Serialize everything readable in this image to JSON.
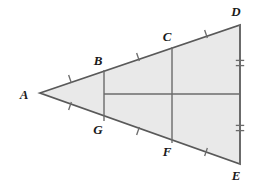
{
  "figure": {
    "type": "geometry-diagram",
    "fill_color": "#e9e9e9",
    "stroke_color": "#6b6b6b",
    "outline_color": "#595959",
    "label_color": "#1a1a1a",
    "background_color": "#ffffff"
  },
  "vertices": [
    {
      "id": "A",
      "label": "A",
      "x": 40,
      "y": 93,
      "label_x": 24,
      "label_y": 99
    },
    {
      "id": "B",
      "label": "B",
      "x": 104,
      "y": 70,
      "label_x": 98,
      "label_y": 65
    },
    {
      "id": "C",
      "label": "C",
      "x": 172,
      "y": 47,
      "label_x": 167,
      "label_y": 41
    },
    {
      "id": "D",
      "label": "D",
      "x": 240,
      "y": 25,
      "label_x": 236,
      "label_y": 16
    },
    {
      "id": "E",
      "label": "E",
      "x": 240,
      "y": 164,
      "label_x": 236,
      "label_y": 180
    },
    {
      "id": "F",
      "label": "F",
      "x": 172,
      "y": 143,
      "label_x": 167,
      "label_y": 156
    },
    {
      "id": "G",
      "label": "G",
      "x": 104,
      "y": 121,
      "label_x": 98,
      "label_y": 134
    }
  ],
  "outline_polygon": "40,93 240,25 240,164",
  "segments": [
    {
      "name": "segment-BG",
      "x1": 104,
      "y1": 70,
      "x2": 104,
      "y2": 121
    },
    {
      "name": "segment-CF",
      "x1": 172,
      "y1": 47,
      "x2": 172,
      "y2": 143
    },
    {
      "name": "segment-midline",
      "x1": 104,
      "y1": 94,
      "x2": 240,
      "y2": 94
    },
    {
      "name": "side-DE",
      "x1": 240,
      "y1": 25,
      "x2": 240,
      "y2": 164
    }
  ],
  "tick_marks": [
    {
      "name": "tick-AB",
      "count": 1,
      "x": 70,
      "y": 79,
      "angle": -18.8
    },
    {
      "name": "tick-BC",
      "count": 1,
      "x": 138,
      "y": 57,
      "angle": -18.8
    },
    {
      "name": "tick-CD",
      "count": 1,
      "x": 206,
      "y": 34,
      "angle": -18.8
    },
    {
      "name": "tick-AG",
      "count": 1,
      "x": 70,
      "y": 106,
      "angle": 18.8
    },
    {
      "name": "tick-GF",
      "count": 1,
      "x": 138,
      "y": 131,
      "angle": 18.8
    },
    {
      "name": "tick-FE",
      "count": 1,
      "x": 206,
      "y": 152,
      "angle": 18.8
    },
    {
      "name": "tick-DE-upper",
      "count": 2,
      "x": 240,
      "y": 63,
      "angle": 90
    },
    {
      "name": "tick-DE-lower",
      "count": 2,
      "x": 240,
      "y": 128,
      "angle": 90
    }
  ]
}
